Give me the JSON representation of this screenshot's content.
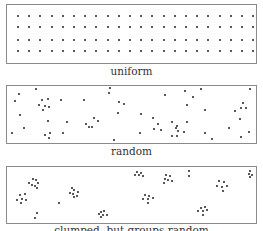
{
  "panels": [
    {
      "caption": "uniform",
      "top": 4,
      "height": 60,
      "grid": {
        "rows": [
          16,
          27,
          40,
          51
        ],
        "x_start": 18,
        "x_step": 11.2,
        "cols": 22
      }
    },
    {
      "caption": "random",
      "top": 85,
      "height": 59,
      "points": [
        [
          19,
          94
        ],
        [
          36,
          89
        ],
        [
          15,
          101
        ],
        [
          42,
          100
        ],
        [
          48,
          99
        ],
        [
          45,
          106
        ],
        [
          39,
          105
        ],
        [
          43,
          110
        ],
        [
          49,
          107
        ],
        [
          61,
          100
        ],
        [
          84,
          100
        ],
        [
          20,
          115
        ],
        [
          48,
          121
        ],
        [
          67,
          122
        ],
        [
          24,
          128
        ],
        [
          12,
          133
        ],
        [
          45,
          135
        ],
        [
          50,
          133
        ],
        [
          49,
          138
        ],
        [
          63,
          133
        ],
        [
          94,
          118
        ],
        [
          86,
          124
        ],
        [
          92,
          127
        ],
        [
          98,
          121
        ],
        [
          110,
          88
        ],
        [
          109,
          93
        ],
        [
          119,
          102
        ],
        [
          118,
          113
        ],
        [
          124,
          104
        ],
        [
          89,
          127
        ],
        [
          114,
          140
        ],
        [
          165,
          95
        ],
        [
          185,
          91
        ],
        [
          201,
          89
        ],
        [
          193,
          97
        ],
        [
          187,
          105
        ],
        [
          205,
          110
        ],
        [
          141,
          114
        ],
        [
          153,
          118
        ],
        [
          158,
          124
        ],
        [
          154,
          129
        ],
        [
          161,
          130
        ],
        [
          172,
          122
        ],
        [
          176,
          128
        ],
        [
          178,
          131
        ],
        [
          177,
          126
        ],
        [
          172,
          136
        ],
        [
          177,
          136
        ],
        [
          184,
          132
        ],
        [
          187,
          122
        ],
        [
          140,
          133
        ],
        [
          205,
          133
        ],
        [
          212,
          139
        ],
        [
          235,
          111
        ],
        [
          243,
          103
        ],
        [
          241,
          108
        ],
        [
          246,
          108
        ],
        [
          240,
          119
        ],
        [
          229,
          128
        ],
        [
          249,
          132
        ],
        [
          241,
          137
        ],
        [
          250,
          89
        ]
      ]
    },
    {
      "caption": "clumped, but groups random",
      "top": 166,
      "height": 58,
      "points": [
        [
          33,
          179
        ],
        [
          36,
          180
        ],
        [
          29,
          183
        ],
        [
          38,
          183
        ],
        [
          32,
          185
        ],
        [
          35,
          186
        ],
        [
          37,
          188
        ],
        [
          20,
          195
        ],
        [
          25,
          194
        ],
        [
          17,
          200
        ],
        [
          22,
          199
        ],
        [
          26,
          200
        ],
        [
          21,
          203
        ],
        [
          37,
          213
        ],
        [
          35,
          218
        ],
        [
          72,
          188
        ],
        [
          74,
          190
        ],
        [
          70,
          193
        ],
        [
          78,
          192
        ],
        [
          73,
          194
        ],
        [
          77,
          196
        ],
        [
          74,
          197
        ],
        [
          59,
          203
        ],
        [
          101,
          212
        ],
        [
          104,
          211
        ],
        [
          99,
          214
        ],
        [
          103,
          215
        ],
        [
          107,
          215
        ],
        [
          101,
          217
        ],
        [
          137,
          172
        ],
        [
          141,
          173
        ],
        [
          135,
          175
        ],
        [
          139,
          175
        ],
        [
          143,
          176
        ],
        [
          166,
          175
        ],
        [
          170,
          176
        ],
        [
          165,
          179
        ],
        [
          168,
          180
        ],
        [
          172,
          181
        ],
        [
          164,
          183
        ],
        [
          189,
          171
        ],
        [
          189,
          176
        ],
        [
          219,
          181
        ],
        [
          224,
          182
        ],
        [
          217,
          186
        ],
        [
          222,
          187
        ],
        [
          227,
          186
        ],
        [
          223,
          191
        ],
        [
          250,
          171
        ],
        [
          249,
          174
        ],
        [
          252,
          175
        ],
        [
          250,
          177
        ],
        [
          145,
          195
        ],
        [
          149,
          196
        ],
        [
          143,
          199
        ],
        [
          148,
          199
        ],
        [
          153,
          198
        ],
        [
          148,
          203
        ],
        [
          201,
          208
        ],
        [
          205,
          207
        ],
        [
          198,
          211
        ],
        [
          203,
          211
        ],
        [
          207,
          210
        ],
        [
          203,
          215
        ]
      ]
    }
  ],
  "captions": {
    "uniform": "uniform",
    "random": "random",
    "clumped": "clumped, but groups random"
  }
}
